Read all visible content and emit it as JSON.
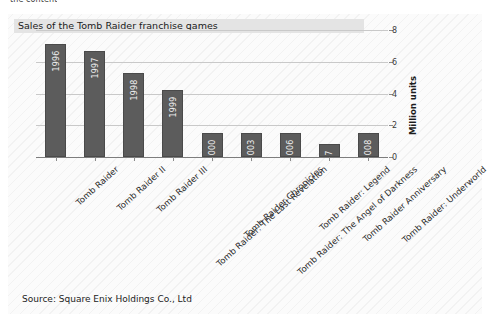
{
  "clipped_header_text": "the content",
  "figure": {
    "title": "Sales of the Tomb Raider franchise games",
    "source": "Source: Square Enix Holdings Co., Ltd"
  },
  "colors": {
    "bar": "#5c5c5c",
    "bar_edge": "#4a4a4a",
    "gridline": "#c9c9c9",
    "axis": "#7d7d7d",
    "title_band": "#e4e4e4",
    "plot_background": "#fbfbfb"
  },
  "chart_data": {
    "type": "bar",
    "title": "Sales of the Tomb Raider franchise games",
    "xlabel": "",
    "ylabel": "Million units",
    "ylim": [
      0,
      8
    ],
    "yticks": [
      0,
      2,
      4,
      6,
      8
    ],
    "grid": true,
    "legend": null,
    "categories": [
      "Tomb Raider",
      "Tomb Raider II",
      "Tomb Raider III",
      "Tomb Raider: The Last Revelation",
      "Tomb Raider Chronicles",
      "Tomb Raider: The Angel of Darkness",
      "Tomb Raider: Legend",
      "Tomb Raider Anniversary",
      "Tomb Raider: Underworld"
    ],
    "values": [
      7.1,
      6.7,
      5.3,
      4.2,
      1.5,
      1.5,
      1.5,
      0.8,
      1.5
    ],
    "bar_annotations": [
      "1996",
      "1997",
      "1998",
      "1999",
      "2000",
      "2003",
      "2006",
      "2007",
      "2008"
    ]
  }
}
